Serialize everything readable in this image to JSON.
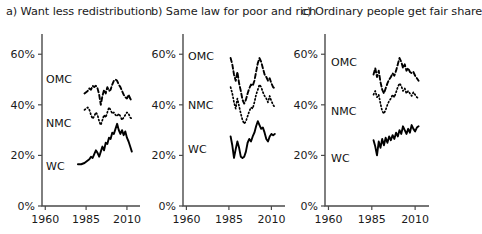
{
  "figure": {
    "type": "multi-panel-line-chart",
    "panel_count": 3
  },
  "panels": [
    {
      "id": "a",
      "title": "a) Want less redistribution",
      "series_labels": {
        "omc": "OMC",
        "nmc": "NMC",
        "wc": "WC"
      }
    },
    {
      "id": "b",
      "title": "b) Same law for poor and rich",
      "series_labels": {
        "omc": "OMC",
        "nmc": "NMC",
        "wc": "WC"
      }
    },
    {
      "id": "c",
      "title": "c) Ordinary people get fair share",
      "series_labels": {
        "omc": "OMC",
        "nmc": "NMC",
        "wc": "WC"
      }
    }
  ],
  "axes": {
    "y_ticks": [
      0,
      20,
      40,
      60
    ],
    "y_tick_labels": [
      "0%",
      "20%",
      "40%",
      "60%"
    ],
    "ylim": [
      0,
      68
    ],
    "x_ticks": [
      1960,
      1985,
      2010
    ],
    "x_tick_labels": [
      "1960",
      "1985",
      "2010"
    ],
    "xlim": [
      1958,
      2018
    ],
    "grid": false,
    "legend_position": "inline-series-labels"
  },
  "colors": {
    "line": "#000000",
    "axis": "#4a4a4a",
    "text": "#1a1a1a",
    "background": "#ffffff"
  },
  "chart_data": [
    {
      "type": "line",
      "panel": "a",
      "title": "a) Want less redistribution",
      "xlabel": "",
      "ylabel": "",
      "ylim": [
        0,
        68
      ],
      "xlim": [
        1958,
        2018
      ],
      "grid": false,
      "legend_position": "inline",
      "series": [
        {
          "name": "OMC",
          "style": "dashed",
          "x": [
            1984,
            1985,
            1986,
            1987,
            1988,
            1989,
            1990,
            1991,
            1992,
            1993,
            1994,
            1995,
            1996,
            1997,
            1998,
            1999,
            2000,
            2001,
            2002,
            2003,
            2004,
            2005,
            2006,
            2007,
            2008,
            2009,
            2010,
            2011,
            2012,
            2013
          ],
          "y": [
            44.5,
            45.0,
            45.5,
            46.5,
            46.0,
            47.5,
            47.0,
            47.5,
            46.5,
            44.0,
            40.0,
            43.5,
            46.0,
            44.5,
            47.0,
            45.5,
            46.0,
            48.0,
            49.5,
            50.0,
            49.5,
            48.0,
            47.0,
            45.5,
            44.0,
            43.0,
            42.5,
            44.0,
            42.5,
            41.5
          ]
        },
        {
          "name": "NMC",
          "style": "dotted",
          "x": [
            1984,
            1985,
            1986,
            1987,
            1988,
            1989,
            1990,
            1991,
            1992,
            1993,
            1994,
            1995,
            1996,
            1997,
            1998,
            1999,
            2000,
            2001,
            2002,
            2003,
            2004,
            2005,
            2006,
            2007,
            2008,
            2009,
            2010,
            2011,
            2012,
            2013
          ],
          "y": [
            38.0,
            38.5,
            39.0,
            38.0,
            36.0,
            34.5,
            35.5,
            37.0,
            36.0,
            33.5,
            32.0,
            34.0,
            36.0,
            35.0,
            37.0,
            39.0,
            38.0,
            36.5,
            37.0,
            36.0,
            35.5,
            36.5,
            35.5,
            34.0,
            35.0,
            36.0,
            37.0,
            36.5,
            35.0,
            34.5
          ]
        },
        {
          "name": "WC",
          "style": "solid",
          "x": [
            1980,
            1982,
            1984,
            1985,
            1986,
            1987,
            1988,
            1989,
            1990,
            1991,
            1992,
            1993,
            1994,
            1995,
            1996,
            1997,
            1998,
            1999,
            2000,
            2001,
            2002,
            2003,
            2004,
            2005,
            2006,
            2007,
            2008,
            2009,
            2010,
            2011,
            2012,
            2013
          ],
          "y": [
            16.5,
            16.5,
            17.0,
            17.5,
            18.0,
            18.5,
            19.5,
            19.0,
            20.5,
            22.0,
            21.0,
            19.5,
            21.5,
            23.5,
            22.0,
            25.0,
            24.5,
            27.0,
            26.5,
            29.0,
            28.5,
            30.5,
            32.5,
            30.0,
            28.5,
            30.0,
            28.0,
            29.5,
            27.0,
            25.5,
            23.5,
            21.5
          ]
        }
      ]
    },
    {
      "type": "line",
      "panel": "b",
      "title": "b) Same law for poor and rich",
      "xlabel": "",
      "ylabel": "",
      "ylim": [
        0,
        68
      ],
      "xlim": [
        1958,
        2018
      ],
      "grid": false,
      "legend_position": "inline",
      "series": [
        {
          "name": "OMC",
          "style": "dashed",
          "x": [
            1986,
            1987,
            1988,
            1989,
            1990,
            1991,
            1992,
            1993,
            1994,
            1995,
            1996,
            1997,
            1998,
            1999,
            2000,
            2001,
            2002,
            2003,
            2004,
            2005,
            2006,
            2007,
            2008,
            2009,
            2010,
            2011,
            2012
          ],
          "y": [
            58.5,
            56.0,
            52.0,
            49.5,
            53.0,
            48.5,
            45.5,
            42.0,
            40.5,
            42.0,
            44.5,
            46.5,
            48.0,
            47.5,
            49.5,
            53.0,
            56.5,
            58.5,
            57.0,
            54.5,
            52.0,
            51.0,
            49.5,
            50.5,
            48.5,
            47.0,
            46.5
          ]
        },
        {
          "name": "NMC",
          "style": "dotted",
          "x": [
            1986,
            1987,
            1988,
            1989,
            1990,
            1991,
            1992,
            1993,
            1994,
            1995,
            1996,
            1997,
            1998,
            1999,
            2000,
            2001,
            2002,
            2003,
            2004,
            2005,
            2006,
            2007,
            2008,
            2009,
            2010,
            2011,
            2012
          ],
          "y": [
            47.0,
            44.5,
            41.0,
            38.5,
            42.5,
            39.5,
            36.5,
            34.0,
            32.5,
            33.5,
            35.5,
            37.5,
            39.0,
            38.5,
            41.0,
            44.0,
            46.0,
            48.0,
            47.0,
            45.0,
            43.5,
            42.5,
            41.0,
            43.5,
            41.5,
            40.0,
            39.0
          ]
        },
        {
          "name": "WC",
          "style": "solid",
          "x": [
            1986,
            1987,
            1988,
            1989,
            1990,
            1991,
            1992,
            1993,
            1994,
            1995,
            1996,
            1997,
            1998,
            1999,
            2000,
            2001,
            2002,
            2003,
            2004,
            2005,
            2006,
            2007,
            2008,
            2009,
            2010,
            2011,
            2012
          ],
          "y": [
            27.5,
            24.0,
            19.0,
            22.5,
            25.5,
            23.0,
            19.5,
            19.0,
            19.5,
            21.5,
            25.0,
            26.5,
            25.5,
            27.5,
            29.0,
            31.5,
            33.5,
            32.0,
            30.5,
            31.0,
            29.0,
            26.5,
            25.5,
            27.5,
            28.5,
            28.0,
            28.5
          ]
        }
      ]
    },
    {
      "type": "line",
      "panel": "c",
      "title": "c) Ordinary people get fair share",
      "xlabel": "",
      "ylabel": "",
      "ylim": [
        0,
        68
      ],
      "xlim": [
        1958,
        2018
      ],
      "grid": false,
      "legend_position": "inline",
      "series": [
        {
          "name": "OMC",
          "style": "dashed",
          "x": [
            1986,
            1987,
            1988,
            1989,
            1990,
            1991,
            1992,
            1993,
            1994,
            1995,
            1996,
            1997,
            1998,
            1999,
            2000,
            2001,
            2002,
            2003,
            2004,
            2005,
            2006,
            2007,
            2008,
            2009,
            2010,
            2011,
            2012
          ],
          "y": [
            52.0,
            54.5,
            51.0,
            53.5,
            49.0,
            46.0,
            44.5,
            46.5,
            48.5,
            50.0,
            51.0,
            52.5,
            51.5,
            53.5,
            56.0,
            58.5,
            57.0,
            54.5,
            56.0,
            53.5,
            54.5,
            53.0,
            52.5,
            53.0,
            51.5,
            50.5,
            49.5
          ]
        },
        {
          "name": "NMC",
          "style": "dotted",
          "x": [
            1986,
            1987,
            1988,
            1989,
            1990,
            1991,
            1992,
            1993,
            1994,
            1995,
            1996,
            1997,
            1998,
            1999,
            2000,
            2001,
            2002,
            2003,
            2004,
            2005,
            2006,
            2007,
            2008,
            2009,
            2010,
            2011,
            2012
          ],
          "y": [
            44.0,
            45.5,
            43.0,
            44.0,
            40.5,
            37.5,
            36.5,
            38.0,
            40.0,
            41.5,
            42.5,
            44.0,
            43.0,
            45.0,
            47.0,
            48.5,
            47.5,
            45.5,
            46.5,
            44.5,
            45.5,
            44.5,
            43.5,
            45.0,
            44.0,
            43.0,
            42.5
          ]
        },
        {
          "name": "WC",
          "style": "solid",
          "x": [
            1986,
            1987,
            1988,
            1989,
            1990,
            1991,
            1992,
            1993,
            1994,
            1995,
            1996,
            1997,
            1998,
            1999,
            2000,
            2001,
            2002,
            2003,
            2004,
            2005,
            2006,
            2007,
            2008,
            2009,
            2010,
            2011,
            2012
          ],
          "y": [
            26.0,
            23.5,
            20.0,
            25.5,
            23.0,
            26.5,
            24.0,
            27.0,
            25.0,
            27.5,
            26.0,
            28.0,
            26.5,
            29.0,
            27.5,
            30.0,
            28.5,
            31.5,
            30.0,
            28.5,
            30.5,
            29.0,
            32.0,
            30.5,
            29.5,
            31.0,
            31.5
          ]
        }
      ]
    }
  ]
}
